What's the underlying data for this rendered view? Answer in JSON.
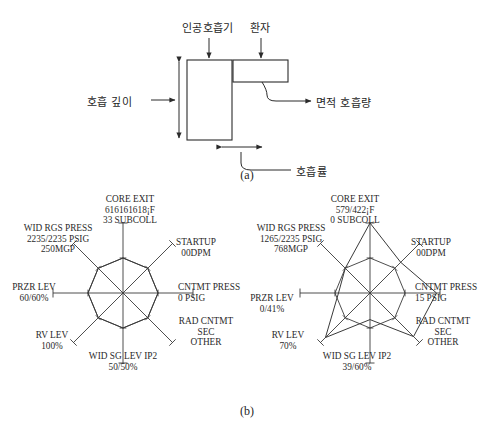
{
  "figure": {
    "panel_a": {
      "caption": "(a)",
      "labels": {
        "ventilator": "인공호흡기",
        "patient": "환자",
        "breath_depth": "호흡 깊이",
        "area_tidal_volume": "면적 호흡량",
        "respiration_rate": "호흡률"
      }
    },
    "panel_b": {
      "caption": "(b)",
      "charts": [
        {
          "id": "left-radar",
          "axes": [
            {
              "name": "core-exit",
              "label_lines": [
                "CORE EXIT",
                "616161618¡F",
                "33 SUBCOLL"
              ],
              "value": 0.5
            },
            {
              "name": "startup",
              "label_lines": [
                "STARTUP",
                "00DPM"
              ],
              "value": 0.5
            },
            {
              "name": "cntmt-press",
              "label_lines": [
                "CNTMT PRESS",
                "0 PSIG"
              ],
              "value": 0.5
            },
            {
              "name": "rad-cntmt",
              "label_lines": [
                "RAD CNTMT",
                "SEC",
                "OTHER"
              ],
              "value": 0.5
            },
            {
              "name": "wid-sg-lev-ip2",
              "label_lines": [
                "WID SG LEV IP2",
                "50/50%"
              ],
              "value": 0.5
            },
            {
              "name": "rv-lev",
              "label_lines": [
                "RV LEV",
                "100%"
              ],
              "value": 0.5
            },
            {
              "name": "przr-lev",
              "label_lines": [
                "PRZR LEV",
                "60/60%"
              ],
              "value": 0.5
            },
            {
              "name": "wid-rgs-press",
              "label_lines": [
                "WID RGS PRESS",
                "2235/2235 PSIG",
                "250MGP"
              ],
              "value": 0.5
            }
          ]
        },
        {
          "id": "right-radar",
          "axes": [
            {
              "name": "core-exit",
              "label_lines": [
                "CORE EXIT",
                "579/422¡F",
                "0 SUBCOLL"
              ],
              "value": 1.0
            },
            {
              "name": "startup",
              "label_lines": [
                "STARTUP",
                "00DPM"
              ],
              "value": 0.62
            },
            {
              "name": "cntmt-press",
              "label_lines": [
                "CNTMT PRESS",
                "15 PSIG"
              ],
              "value": 0.95
            },
            {
              "name": "rad-cntmt",
              "label_lines": [
                "RAD CNTMT",
                "SEC",
                "OTHER"
              ],
              "value": 0.88
            },
            {
              "name": "wid-sg-lev-ip2",
              "label_lines": [
                "WID SG LEV IP2",
                "39/60%"
              ],
              "value": 0.38
            },
            {
              "name": "rv-lev",
              "label_lines": [
                "RV LEV",
                "70%"
              ],
              "value": 0.9
            },
            {
              "name": "przr-lev",
              "label_lines": [
                "PRZR LEV",
                "0/41%"
              ],
              "value": 0.45
            },
            {
              "name": "wid-rgs-press",
              "label_lines": [
                "WID RGS PRESS",
                "1265/2235 PSIG",
                "768MGP"
              ],
              "value": 0.5
            }
          ]
        }
      ]
    }
  },
  "chart_data": [
    {
      "type": "radar",
      "id": "left-radar",
      "title": "",
      "categories": [
        "CORE EXIT",
        "STARTUP",
        "CNTMT PRESS",
        "RAD CNTMT SEC OTHER",
        "WID SG LEV IP2",
        "RV LEV",
        "PRZR LEV",
        "WID RGS PRESS"
      ],
      "values": [
        0.5,
        0.5,
        0.5,
        0.5,
        0.5,
        0.5,
        0.5,
        0.5
      ],
      "value_labels": [
        "616161618¡F 33 SUBCOLL",
        "00DPM",
        "0 PSIG",
        "OTHER",
        "50/50%",
        "100%",
        "60/60%",
        "2235/2235 PSIG 250MGP"
      ],
      "rlim": [
        0,
        1
      ],
      "grid": true,
      "legend": "none",
      "xlabel": "",
      "ylabel": ""
    },
    {
      "type": "radar",
      "id": "right-radar",
      "title": "",
      "categories": [
        "CORE EXIT",
        "STARTUP",
        "CNTMT PRESS",
        "RAD CNTMT SEC OTHER",
        "WID SG LEV IP2",
        "RV LEV",
        "PRZR LEV",
        "WID RGS PRESS"
      ],
      "values": [
        1.0,
        0.62,
        0.95,
        0.88,
        0.38,
        0.9,
        0.45,
        0.5
      ],
      "value_labels": [
        "579/422¡F 0 SUBCOLL",
        "00DPM",
        "15 PSIG",
        "OTHER",
        "39/60%",
        "70%",
        "0/41%",
        "1265/2235 PSIG 768MGP"
      ],
      "rlim": [
        0,
        1
      ],
      "grid": true,
      "legend": "none",
      "xlabel": "",
      "ylabel": ""
    }
  ],
  "colors": {
    "line": "#2b2b2b",
    "text": "#1f1f1f",
    "background": "#ffffff"
  }
}
